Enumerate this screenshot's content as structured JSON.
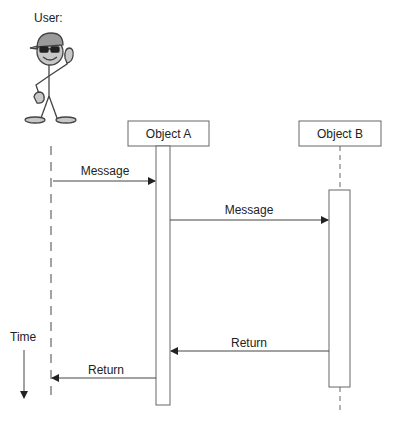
{
  "diagram": {
    "type": "sequence",
    "actor": {
      "label": "User:"
    },
    "objects": [
      {
        "id": "A",
        "label": "Object A"
      },
      {
        "id": "B",
        "label": "Object B"
      }
    ],
    "messages": [
      {
        "from": "User",
        "to": "Object A",
        "label": "Message",
        "kind": "call"
      },
      {
        "from": "Object A",
        "to": "Object B",
        "label": "Message",
        "kind": "call"
      },
      {
        "from": "Object B",
        "to": "Object A",
        "label": "Return",
        "kind": "return"
      },
      {
        "from": "Object A",
        "to": "User",
        "label": "Return",
        "kind": "return"
      }
    ],
    "time_axis": {
      "label": "Time",
      "direction": "down"
    },
    "colors": {
      "line": "#555555",
      "figure_fill": "#bdbdbd",
      "box_border": "#666666"
    }
  }
}
